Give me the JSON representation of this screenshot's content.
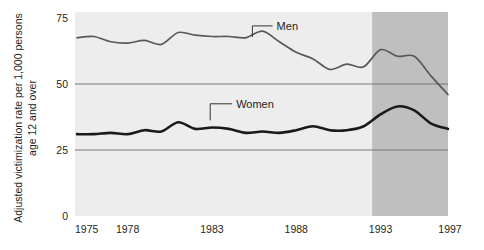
{
  "chart_data": {
    "type": "line",
    "title": "",
    "xlabel": "",
    "ylabel": "Adjusted victimization rate per 1,000 persons age 12 and over",
    "xlim": [
      1975,
      1997
    ],
    "ylim": [
      0,
      75
    ],
    "yticks": [
      0,
      25,
      50,
      75
    ],
    "ytick_labels": [
      "0",
      "25",
      "50",
      "75"
    ],
    "xticks": [
      1975,
      1978,
      1983,
      1988,
      1993,
      1997
    ],
    "xtick_labels": [
      "1975",
      "1978",
      "1983",
      "1988",
      "1993",
      "1997"
    ],
    "grid": "horizontal gridlines at 25, 50, 75",
    "legend": "inline labels with leader lines",
    "shaded_region": {
      "label": "",
      "x_start": 1992.5,
      "x_end": 1997
    },
    "x": [
      1975,
      1976,
      1977,
      1978,
      1979,
      1980,
      1981,
      1982,
      1983,
      1984,
      1985,
      1986,
      1987,
      1988,
      1989,
      1990,
      1991,
      1992,
      1993,
      1994,
      1995,
      1996,
      1997
    ],
    "series": [
      {
        "name": "Men",
        "color": "#595959",
        "values": [
          67.5,
          68.0,
          66.0,
          65.5,
          66.5,
          65.0,
          69.5,
          68.5,
          68.0,
          68.0,
          67.5,
          70.0,
          66.0,
          62.0,
          59.5,
          55.5,
          57.5,
          56.5,
          63.0,
          60.5,
          60.5,
          53.0,
          46.0
        ]
      },
      {
        "name": "Women",
        "color": "#1a1a1a",
        "values": [
          31.0,
          31.0,
          31.5,
          31.0,
          32.5,
          32.0,
          35.5,
          33.0,
          33.5,
          33.0,
          31.5,
          32.0,
          31.5,
          32.5,
          34.0,
          32.5,
          32.5,
          34.0,
          38.5,
          41.5,
          40.0,
          35.0,
          33.0
        ]
      }
    ],
    "annotations": [
      {
        "text": "Men",
        "x": 1985.4,
        "y": 67.8,
        "label_x": 1986.6,
        "label_y": 72.0
      },
      {
        "text": "Women",
        "x": 1982.9,
        "y": 36.2,
        "label_x": 1984.2,
        "label_y": 42.5
      }
    ]
  },
  "colors": {
    "plot_background": "#ededed",
    "plot_background_shaded": "#bfbfbf",
    "gridline": "#6e6e6e",
    "men_line": "#595959",
    "women_line": "#1a1a1a",
    "text": "#231f20",
    "page_background": "#ffffff"
  }
}
